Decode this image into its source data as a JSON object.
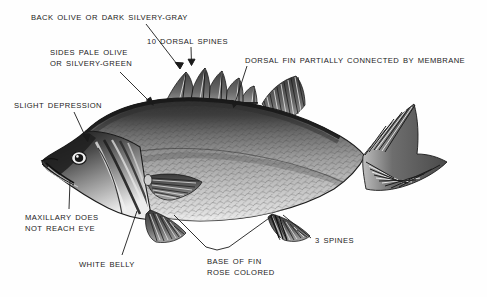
{
  "figure": {
    "background_color": "#fefefe",
    "ink_color": "#1a1a1a",
    "width": 487,
    "height": 297
  },
  "labels": [
    {
      "id": "back-color",
      "name": "label-back-olive-or-dark-silvery-gray",
      "lines": [
        "BACK OLIVE OR DARK SILVERY-GRAY"
      ],
      "x": 31,
      "y": 12,
      "leader": [
        [
          146,
          24
        ],
        [
          180,
          68
        ]
      ],
      "arrow": true
    },
    {
      "id": "dorsal-spines",
      "name": "label-10-dorsal-spines",
      "lines": [
        "10 DORSAL SPINES"
      ],
      "x": 147,
      "y": 36,
      "leader": [
        [
          191,
          47
        ],
        [
          191,
          64
        ]
      ],
      "arrow": true
    },
    {
      "id": "dorsal-membrane",
      "name": "label-dorsal-fin-partially-connected-by-membrane",
      "lines": [
        "DORSAL FIN PARTIALLY CONNECTED BY MEMBRANE"
      ],
      "x": 245,
      "y": 55,
      "leader": [
        [
          247,
          66
        ],
        [
          234,
          106
        ]
      ],
      "arrow": true
    },
    {
      "id": "sides-color",
      "name": "label-sides-pale-olive-or-silvery-green",
      "lines": [
        "SIDES PALE OLIVE",
        "OR SILVERY-GREEN"
      ],
      "x": 50,
      "y": 47,
      "leader": [
        [
          120,
          72
        ],
        [
          152,
          104
        ]
      ],
      "arrow": true
    },
    {
      "id": "slight-depression",
      "name": "label-slight-depression",
      "lines": [
        "SLIGHT DEPRESSION"
      ],
      "x": 14,
      "y": 100,
      "leader": [
        [
          74,
          112
        ],
        [
          87,
          140
        ]
      ],
      "arrow": true
    },
    {
      "id": "maxillary",
      "name": "label-maxillary-does-not-reach-eye",
      "lines": [
        "MAXILLARY DOES",
        "NOT REACH EYE"
      ],
      "x": 25,
      "y": 212,
      "leader": [
        [
          69,
          209
        ],
        [
          70,
          182
        ]
      ],
      "arrow": false
    },
    {
      "id": "white-belly",
      "name": "label-white-belly",
      "lines": [
        "WHITE  BELLY"
      ],
      "x": 79,
      "y": 259,
      "leader": [
        [
          122,
          255
        ],
        [
          136,
          212
        ]
      ],
      "arrow": false
    },
    {
      "id": "base-of-fin",
      "name": "label-base-of-fin-rose-colored",
      "lines": [
        "BASE OF FIN",
        "ROSE COLORED"
      ],
      "x": 207,
      "y": 256,
      "leader": [
        [
          206,
          247
        ],
        [
          174,
          215
        ]
      ],
      "leader2": [
        [
          229,
          247
        ],
        [
          272,
          216
        ]
      ],
      "arrow": false
    },
    {
      "id": "three-spines",
      "name": "label-3-spines",
      "lines": [
        "3 SPINES"
      ],
      "x": 315,
      "y": 235,
      "leader": [
        [
          311,
          238
        ],
        [
          283,
          215
        ]
      ],
      "arrow": false
    }
  ],
  "fish": {
    "parts": [
      "body",
      "head",
      "eye",
      "mouth",
      "maxillary",
      "gill-cover",
      "lateral-line",
      "spinous-dorsal-fin",
      "soft-dorsal-fin",
      "caudal-fin",
      "pectoral-fin",
      "pelvic-fin",
      "anal-fin",
      "scales"
    ],
    "spinous_dorsal_spine_count": 10,
    "anal_spine_count": 3
  }
}
